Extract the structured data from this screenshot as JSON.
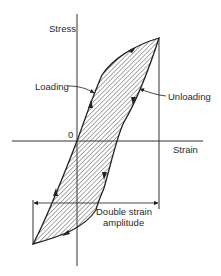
{
  "diagram": {
    "type": "hysteresis-loop",
    "axes": {
      "y_label": "Stress",
      "x_label": "Strain",
      "origin_label": "0"
    },
    "annotations": {
      "loading": "Loading",
      "unloading": "Unloading",
      "amplitude_line1": "Double strain",
      "amplitude_line2": "amplitude"
    },
    "colors": {
      "stroke": "#222222",
      "hatch": "#555555",
      "background": "#ffffff"
    }
  }
}
